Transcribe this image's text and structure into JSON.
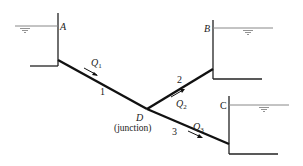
{
  "diagram": {
    "type": "three-reservoir pipe network",
    "reservoirs": [
      {
        "id": "A",
        "label": "A"
      },
      {
        "id": "B",
        "label": "B"
      },
      {
        "id": "C",
        "label": "C"
      }
    ],
    "pipes": [
      {
        "id": "1",
        "label": "1",
        "flow": "Q",
        "flow_sub": "1",
        "from": "A",
        "to": "D"
      },
      {
        "id": "2",
        "label": "2",
        "flow": "Q",
        "flow_sub": "2",
        "from": "D",
        "to": "B"
      },
      {
        "id": "3",
        "label": "3",
        "flow": "Q",
        "flow_sub": "3",
        "from": "D",
        "to": "C"
      }
    ],
    "junction": {
      "label": "D",
      "caption": "(junction)"
    },
    "colors": {
      "line": "#111111",
      "water_line": "#888888"
    }
  }
}
